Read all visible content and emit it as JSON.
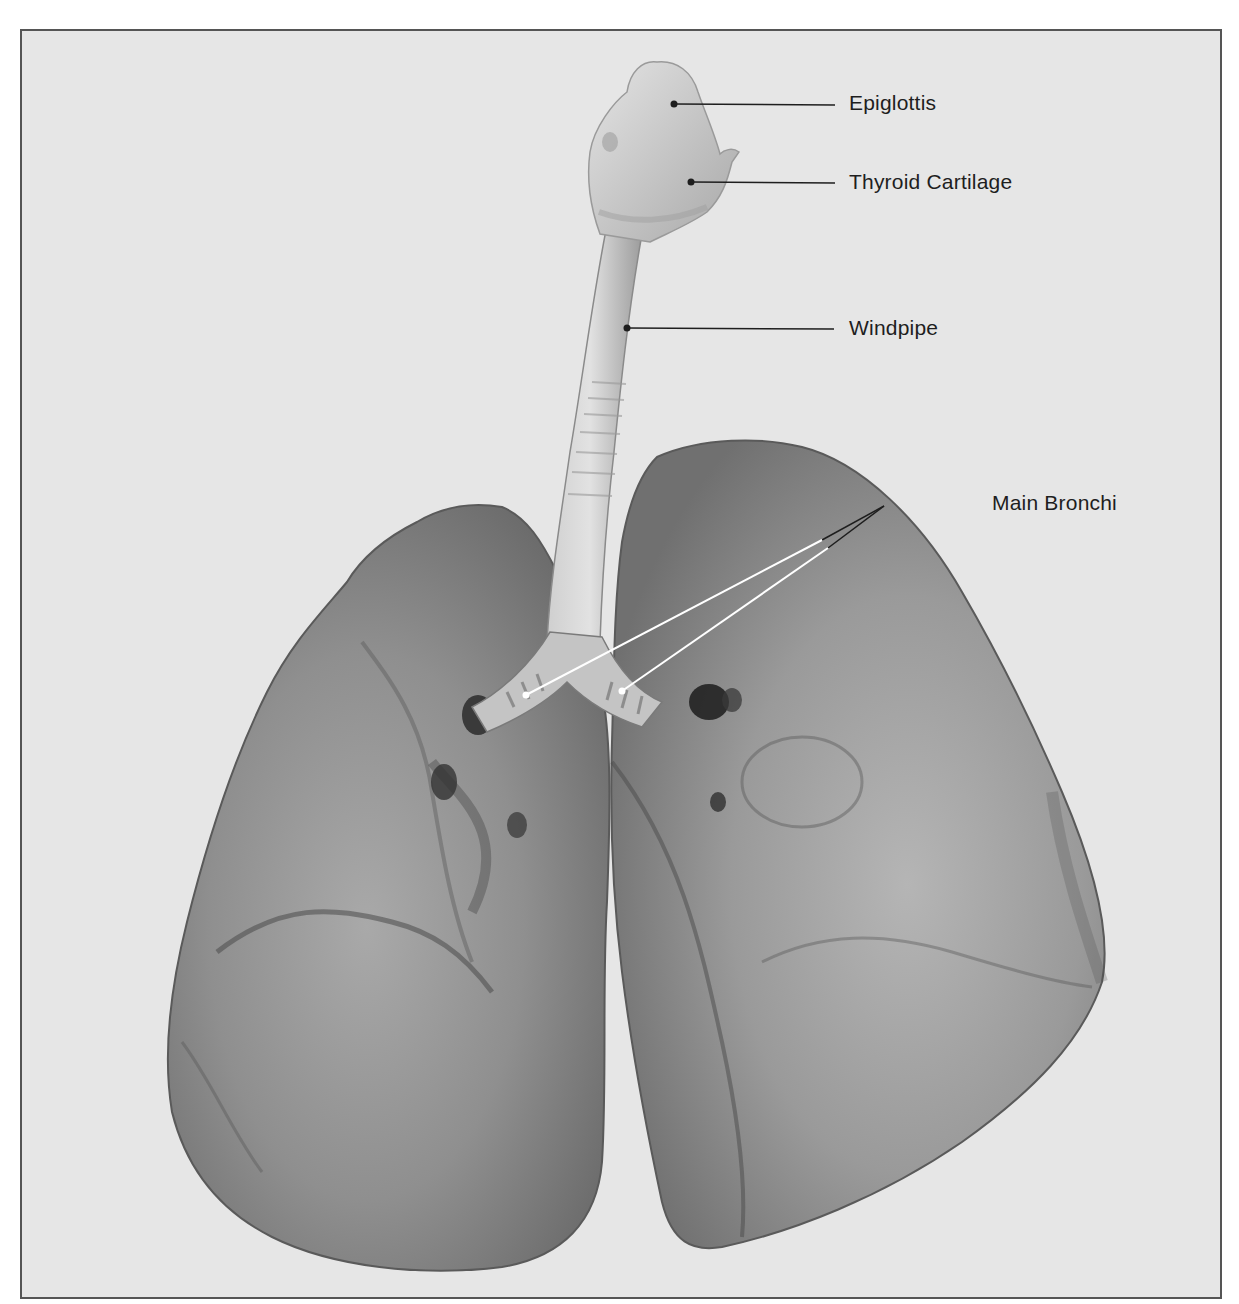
{
  "figure": {
    "background_color": "#e6e6e6",
    "frame_color": "#555555",
    "label_color": "#1e1e1e",
    "leader_line_color_dark": "#1e1e1e",
    "leader_line_color_light": "#ffffff"
  },
  "labels": [
    {
      "id": "epiglottis",
      "text": "Epiglottis"
    },
    {
      "id": "thyroid-cartilage",
      "text": "Thyroid Cartilage"
    },
    {
      "id": "windpipe",
      "text": "Windpipe"
    },
    {
      "id": "main-bronchi",
      "text": "Main Bronchi"
    }
  ]
}
